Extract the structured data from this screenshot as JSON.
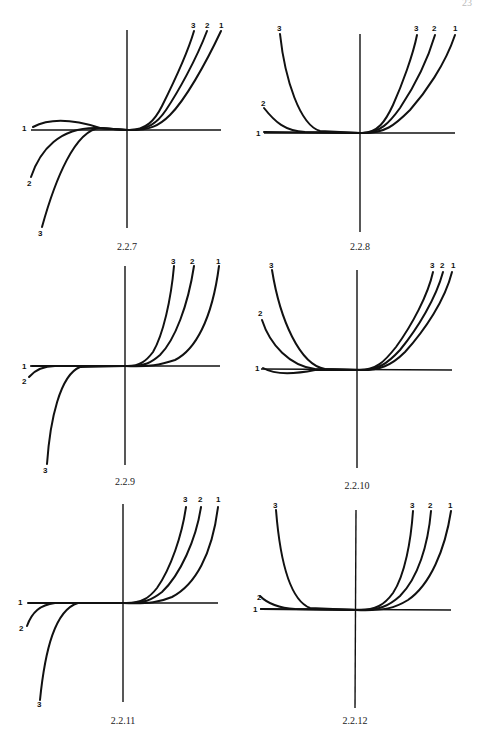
{
  "page": {
    "page_number": "23"
  },
  "figures": [
    {
      "id": "fig-2-2-7",
      "caption": "2.2.7",
      "labels": {
        "left_1": "1",
        "left_2": "2",
        "left_3": "3",
        "right_3": "3",
        "right_2": "2",
        "right_1": "1"
      }
    },
    {
      "id": "fig-2-2-8",
      "caption": "2.2.8",
      "labels": {
        "left_1": "1",
        "left_2": "2",
        "left_3": "3",
        "right_3": "3",
        "right_2": "2",
        "right_1": "1"
      }
    },
    {
      "id": "fig-2-2-9",
      "caption": "2.2.9",
      "labels": {
        "left_1": "1",
        "left_2": "2",
        "left_3": "3",
        "right_3": "3",
        "right_2": "2",
        "right_1": "1"
      }
    },
    {
      "id": "fig-2-2-10",
      "caption": "2.2.10",
      "labels": {
        "left_1": "1",
        "left_2": "2",
        "left_3": "3",
        "right_3": "3",
        "right_2": "2",
        "right_1": "1"
      }
    },
    {
      "id": "fig-2-2-11",
      "caption": "2.2.11",
      "labels": {
        "left_1": "1",
        "left_2": "2",
        "left_3": "3",
        "right_3": "3",
        "right_2": "2",
        "right_1": "1"
      }
    },
    {
      "id": "fig-2-2-12",
      "caption": "2.2.12",
      "labels": {
        "left_1": "1",
        "left_2": "2",
        "left_3": "3",
        "right_3": "3",
        "right_2": "2",
        "right_1": "1"
      }
    }
  ]
}
